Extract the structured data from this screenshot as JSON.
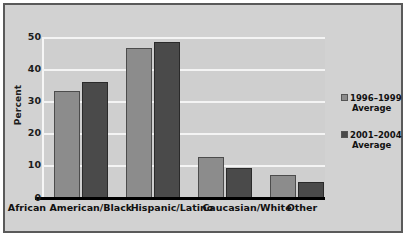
{
  "chart_data": {
    "type": "bar",
    "title": "",
    "xlabel": "",
    "ylabel": "Percent",
    "ylim": [
      0,
      50
    ],
    "yticks": [
      "0",
      "10",
      "20",
      "30",
      "40",
      "50"
    ],
    "grid": true,
    "legend_position": "right",
    "categories": [
      "African American/Black",
      "Hispanic/Latino",
      "Caucasian/White",
      "Other"
    ],
    "series": [
      {
        "name": "1996–1999 Average",
        "name_line1": "1996–1999",
        "name_line2": "Average",
        "color": "#8c8c8c",
        "values": [
          33.2,
          46.5,
          12.7,
          7.0
        ]
      },
      {
        "name": "2001–2004 Average",
        "name_line1": "2001–2004",
        "name_line2": "Average",
        "color": "#4a4a4a",
        "values": [
          36.0,
          48.3,
          9.3,
          5.0
        ]
      }
    ]
  },
  "figure": {
    "plot_background": "#cfcfcf",
    "panel_background": "#d2d2d2",
    "gridline_color": "#f4f4f4",
    "frame_color": "#5a5a5a",
    "axis_color": "#000000"
  },
  "caption": {
    "text": ""
  }
}
